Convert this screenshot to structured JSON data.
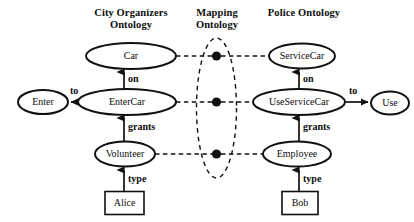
{
  "figure": {
    "kind": "ontology-mapping-diagram",
    "background_color": "#ffffff",
    "stroke_color": "#111111"
  },
  "headings": {
    "left": "City Organizers\nOntology",
    "center": "Mapping\nOntology",
    "right": "Police Ontology"
  },
  "left_ontology": {
    "nodes": {
      "car": "Car",
      "enter_car": "EnterCar",
      "volunteer": "Volunteer",
      "enter": "Enter"
    },
    "instance_box": "Alice",
    "edges": {
      "on": "on",
      "grants": "grants",
      "type": "type",
      "to": "to"
    }
  },
  "right_ontology": {
    "nodes": {
      "service_car": "ServiceCar",
      "use_service_car": "UseServiceCar",
      "employee": "Employee",
      "use": "Use"
    },
    "instance_box": "Bob",
    "edges": {
      "on": "on",
      "grants": "grants",
      "type": "type",
      "to": "to"
    }
  },
  "mapping_ontology": {
    "mapping_points": [
      {
        "name": "car-servicecar-mapping"
      },
      {
        "name": "entercar-useservicecar-mapping"
      },
      {
        "name": "volunteer-employee-mapping"
      }
    ]
  }
}
